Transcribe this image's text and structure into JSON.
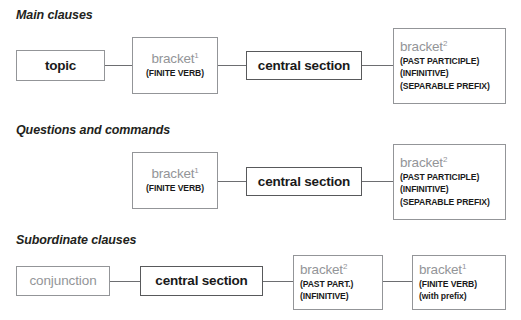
{
  "diagram": {
    "colors": {
      "text_dark": "#1a1a1a",
      "text_grey": "#939598",
      "border": "#939598",
      "connector": "#6d6e71",
      "background": "#ffffff"
    }
  },
  "sections": [
    {
      "id": "main-clauses",
      "heading": "Main clauses",
      "boxes": [
        {
          "id": "topic",
          "main_label": "topic",
          "superscript": "",
          "qualifiers": []
        },
        {
          "id": "bracket1",
          "main_label": "bracket",
          "superscript": "1",
          "qualifiers": [
            "(FINITE VERB)"
          ]
        },
        {
          "id": "central-section",
          "main_label": "central section",
          "superscript": "",
          "qualifiers": []
        },
        {
          "id": "bracket2",
          "main_label": "bracket",
          "superscript": "2",
          "qualifiers": [
            "(PAST PARTICIPLE)",
            "(INFINITIVE)",
            "(SEPARABLE PREFIX)"
          ]
        }
      ]
    },
    {
      "id": "questions-and-commands",
      "heading": "Questions and commands",
      "boxes": [
        {
          "id": "bracket1",
          "main_label": "bracket",
          "superscript": "1",
          "qualifiers": [
            "(FINITE VERB)"
          ]
        },
        {
          "id": "central-section",
          "main_label": "central section",
          "superscript": "",
          "qualifiers": []
        },
        {
          "id": "bracket2",
          "main_label": "bracket",
          "superscript": "2",
          "qualifiers": [
            "(PAST PARTICIPLE)",
            "(INFINITIVE)",
            "(SEPARABLE PREFIX)"
          ]
        }
      ]
    },
    {
      "id": "subordinate-clauses",
      "heading": "Subordinate clauses",
      "boxes": [
        {
          "id": "conjunction",
          "main_label": "conjunction",
          "superscript": "",
          "qualifiers": []
        },
        {
          "id": "central-section",
          "main_label": "central section",
          "superscript": "",
          "qualifiers": []
        },
        {
          "id": "bracket2",
          "main_label": "bracket",
          "superscript": "2",
          "qualifiers": [
            "(PAST PART.)",
            "(INFINITIVE)"
          ]
        },
        {
          "id": "bracket1",
          "main_label": "bracket",
          "superscript": "1",
          "qualifiers": [
            "(FINITE VERB)",
            "(with prefix)"
          ]
        }
      ]
    }
  ]
}
